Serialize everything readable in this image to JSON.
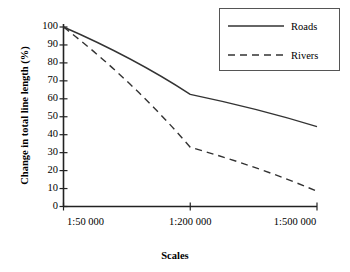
{
  "chart_data": {
    "type": "line",
    "title": "",
    "xlabel": "Scales",
    "ylabel": "Change in total line length (%)",
    "categories": [
      "1:50 000",
      "1:200 000",
      "1:500 000"
    ],
    "x_tick_labels": [
      "1:50 000",
      "1:200 000",
      "1:500 000"
    ],
    "y_tick_labels": [
      "0",
      "10",
      "20",
      "30",
      "40",
      "50",
      "60",
      "70",
      "80",
      "90",
      "100"
    ],
    "y_ticks": [
      0,
      10,
      20,
      30,
      40,
      50,
      60,
      70,
      80,
      90,
      100
    ],
    "ylim": [
      0,
      100
    ],
    "xlim": [
      0,
      2
    ],
    "grid": false,
    "legend_position": "top-right",
    "series": [
      {
        "name": "Roads",
        "style": "solid",
        "color": "#333333",
        "values": [
          100,
          62.5,
          44.5
        ]
      },
      {
        "name": "Rivers",
        "style": "dashed",
        "color": "#333333",
        "values": [
          100,
          33,
          8.5
        ]
      }
    ]
  },
  "axis": {
    "y_title": "Change in total line length (%)",
    "x_title": "Scales"
  },
  "legend": {
    "entries": [
      {
        "label": "Roads",
        "style": "solid"
      },
      {
        "label": "Rivers",
        "style": "dashed"
      }
    ]
  }
}
